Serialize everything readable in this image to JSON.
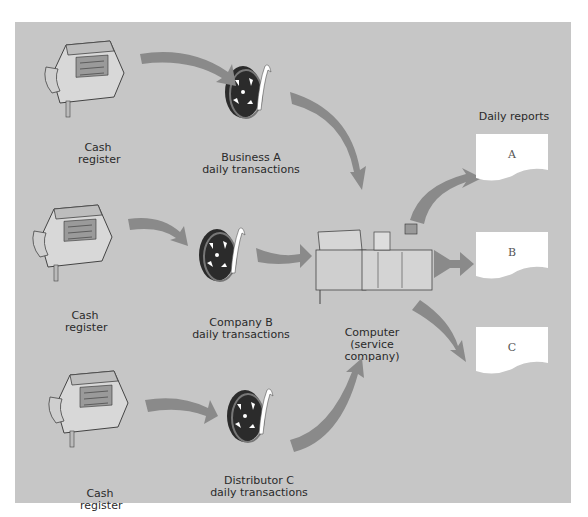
{
  "colors": {
    "background": "#c6c6c6",
    "arrow": "#8a8a8a",
    "document": "#ffffff",
    "text": "#2a2a2a"
  },
  "sources": [
    {
      "device_label_line1": "Cash",
      "device_label_line2": "register",
      "tape_label_line1": "Business A",
      "tape_label_line2": "daily transactions",
      "icon": "cash-register-icon"
    },
    {
      "device_label_line1": "Cash",
      "device_label_line2": "register",
      "tape_label_line1": "Company B",
      "tape_label_line2": "daily transactions",
      "icon": "cash-register-icon"
    },
    {
      "device_label_line1": "Cash",
      "device_label_line2": "register",
      "tape_label_line1": "Distributor C",
      "tape_label_line2": "daily transactions",
      "icon": "cash-register-icon"
    }
  ],
  "computer": {
    "label_line1": "Computer",
    "label_line2": "(service",
    "label_line3": "company)"
  },
  "reports": {
    "title": "Daily reports",
    "items": [
      "A",
      "B",
      "C"
    ]
  }
}
